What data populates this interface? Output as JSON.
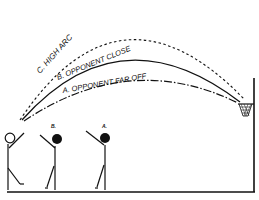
{
  "diagram": {
    "arcs": [
      {
        "id": "c",
        "label": "C. HIGH ARC",
        "style": "dashed"
      },
      {
        "id": "b",
        "label": "B. OPPONENT CLOSE",
        "style": "solid"
      },
      {
        "id": "a",
        "label": "A. OPPONENT FAR OFF",
        "style": "dash-dot"
      }
    ],
    "players": [
      {
        "label": "",
        "role": "shooter"
      },
      {
        "label": "B.",
        "role": "opponent-close"
      },
      {
        "label": "A.",
        "role": "opponent-far"
      }
    ],
    "colors": {
      "ink": "#111111",
      "background": "#ffffff"
    }
  }
}
